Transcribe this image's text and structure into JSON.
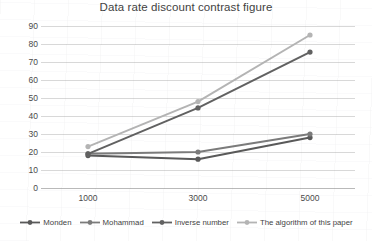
{
  "chart_data": {
    "type": "line",
    "title": "Data rate discount contrast figure",
    "xlabel": "",
    "ylabel": "",
    "categories": [
      "1000",
      "3000",
      "5000"
    ],
    "x": [
      1000,
      3000,
      5000
    ],
    "ylim": [
      0,
      90
    ],
    "ytick_step": 10,
    "yticks": [
      "90",
      "80",
      "70",
      "60",
      "50",
      "40",
      "30",
      "20",
      "10",
      "0"
    ],
    "grid": "horizontal",
    "legend_position": "bottom",
    "series": [
      {
        "name": "Monden",
        "values": [
          18,
          16,
          28
        ],
        "color": "#595959",
        "marker": "circle"
      },
      {
        "name": "Mohammad",
        "values": [
          19,
          20,
          30
        ],
        "color": "#7b7b7b",
        "marker": "circle"
      },
      {
        "name": "Inverse number",
        "values": [
          19,
          44.5,
          75.5
        ],
        "color": "#616161",
        "marker": "circle"
      },
      {
        "name": "The algorithm of this paper",
        "values": [
          23,
          48,
          85
        ],
        "color": "#b4b4b4",
        "marker": "circle"
      }
    ]
  },
  "legend": {
    "items": [
      {
        "label": "Monden"
      },
      {
        "label": "Mohammad"
      },
      {
        "label": "Inverse number"
      },
      {
        "label": "The algorithm of this paper"
      }
    ]
  }
}
